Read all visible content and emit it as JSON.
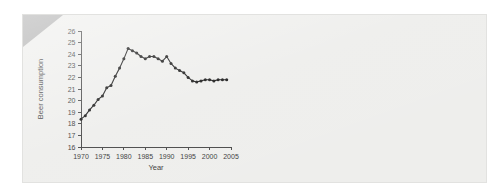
{
  "page": {
    "background_color": "#ffffff",
    "panel_background_color": "#eeeeec",
    "panel_border_color": "#e2e2e0",
    "corner_fold_color": "#a9a9a9"
  },
  "chart_data": {
    "type": "line",
    "title": "",
    "xlabel": "Year",
    "ylabel": "Beer consumption",
    "xlim": [
      1970,
      2005
    ],
    "ylim": [
      16,
      26
    ],
    "xticks": [
      1970,
      1975,
      1980,
      1985,
      1990,
      1995,
      2000,
      2005
    ],
    "xtick_labels": [
      "1970",
      "1975",
      "1980",
      "1985",
      "1990",
      "1995",
      "2000",
      "2005"
    ],
    "yticks": [
      16,
      17,
      18,
      19,
      20,
      21,
      22,
      23,
      24,
      25,
      26
    ],
    "ytick_labels": [
      "16",
      "17",
      "18",
      "19",
      "20",
      "21",
      "22",
      "23",
      "24",
      "25",
      "26"
    ],
    "grid": false,
    "legend": false,
    "marker": "filled-circle",
    "line_color": "#1b1b1b",
    "x": [
      1970,
      1971,
      1972,
      1973,
      1974,
      1975,
      1976,
      1977,
      1978,
      1979,
      1980,
      1981,
      1982,
      1983,
      1984,
      1985,
      1986,
      1987,
      1988,
      1989,
      1990,
      1991,
      1992,
      1993,
      1994,
      1995,
      1996,
      1997,
      1998,
      1999,
      2000,
      2001,
      2002,
      2003,
      2004
    ],
    "y": [
      18.4,
      18.7,
      19.2,
      19.6,
      20.1,
      20.4,
      21.1,
      21.3,
      22.1,
      22.8,
      23.6,
      24.5,
      24.3,
      24.1,
      23.8,
      23.6,
      23.8,
      23.8,
      23.6,
      23.4,
      23.8,
      23.2,
      22.8,
      22.6,
      22.4,
      22.0,
      21.7,
      21.6,
      21.7,
      21.8,
      21.8,
      21.7,
      21.8,
      21.8,
      21.8
    ],
    "series": [
      {
        "name": "Beer consumption",
        "values": [
          18.4,
          18.7,
          19.2,
          19.6,
          20.1,
          20.4,
          21.1,
          21.3,
          22.1,
          22.8,
          23.6,
          24.5,
          24.3,
          24.1,
          23.8,
          23.6,
          23.8,
          23.8,
          23.6,
          23.4,
          23.8,
          23.2,
          22.8,
          22.6,
          22.4,
          22.0,
          21.7,
          21.6,
          21.7,
          21.8,
          21.8,
          21.7,
          21.8,
          21.8,
          21.8
        ]
      }
    ]
  }
}
